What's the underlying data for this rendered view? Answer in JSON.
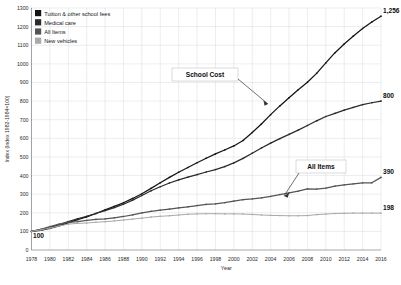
{
  "chart_data": {
    "type": "line",
    "title": "",
    "xlabel": "Year",
    "ylabel": "Index (Index 1982-1984=100)",
    "xlim": [
      1978,
      2016
    ],
    "ylim": [
      0,
      1300
    ],
    "grid": true,
    "legend_position": "top-left",
    "x": [
      1978,
      1979,
      1980,
      1981,
      1982,
      1983,
      1984,
      1985,
      1986,
      1987,
      1988,
      1989,
      1990,
      1991,
      1992,
      1993,
      1994,
      1995,
      1996,
      1997,
      1998,
      1999,
      2000,
      2001,
      2002,
      2003,
      2004,
      2005,
      2006,
      2007,
      2008,
      2009,
      2010,
      2011,
      2012,
      2013,
      2014,
      2015,
      2016
    ],
    "xticks": [
      "1978",
      "1980",
      "1982",
      "1984",
      "1986",
      "1988",
      "1990",
      "1992",
      "1994",
      "1996",
      "1998",
      "2000",
      "2002",
      "2004",
      "2006",
      "2008",
      "2010",
      "2012",
      "2014",
      "2016"
    ],
    "yticks": [
      "0",
      "100",
      "200",
      "300",
      "400",
      "500",
      "600",
      "700",
      "800",
      "900",
      "1000",
      "1100",
      "1200",
      "1300"
    ],
    "series": [
      {
        "name": "Tuition & other school fees",
        "color": "#141414",
        "end_value": 1256,
        "start_value": 100,
        "values": [
          100,
          106,
          116,
          130,
          146,
          163,
          178,
          196,
          216,
          234,
          254,
          277,
          302,
          331,
          361,
          390,
          418,
          443,
          469,
          493,
          516,
          537,
          559,
          588,
          631,
          677,
          727,
          774,
          818,
          861,
          901,
          949,
          1005,
          1060,
          1107,
          1150,
          1190,
          1225,
          1256
        ]
      },
      {
        "name": "Medical care",
        "color": "#2a2a2a",
        "end_value": 800,
        "start_value": 100,
        "values": [
          100,
          110,
          122,
          136,
          152,
          168,
          181,
          196,
          212,
          228,
          246,
          268,
          293,
          318,
          340,
          360,
          377,
          391,
          405,
          419,
          432,
          448,
          468,
          492,
          520,
          548,
          574,
          598,
          621,
          644,
          669,
          694,
          717,
          734,
          751,
          766,
          781,
          791,
          800
        ]
      },
      {
        "name": "All Items",
        "color": "#555555",
        "end_value": 390,
        "start_value": 100,
        "values": [
          100,
          111,
          126,
          139,
          148,
          152,
          159,
          164,
          167,
          173,
          180,
          189,
          199,
          208,
          214,
          220,
          226,
          232,
          239,
          245,
          248,
          254,
          263,
          270,
          274,
          280,
          288,
          298,
          307,
          316,
          328,
          327,
          332,
          343,
          350,
          355,
          361,
          361,
          390
        ]
      },
      {
        "name": "New vehicles",
        "color": "#a9a9a9",
        "end_value": 198,
        "start_value": 100,
        "values": [
          100,
          108,
          118,
          129,
          139,
          143,
          145,
          149,
          152,
          156,
          161,
          166,
          171,
          177,
          181,
          184,
          188,
          192,
          194,
          195,
          195,
          194,
          194,
          193,
          191,
          188,
          186,
          185,
          184,
          184,
          185,
          190,
          193,
          196,
          197,
          198,
          198,
          198,
          198
        ]
      }
    ],
    "annotations": [
      {
        "text": "School Cost",
        "target_series": "Tuition & other school fees"
      },
      {
        "text": "All Items",
        "target_series": "All Items"
      }
    ],
    "end_labels": [
      "1,256",
      "800",
      "390",
      "198"
    ],
    "origin_label": "100"
  },
  "legend": {
    "items": [
      {
        "label": "Tuition & other school fees",
        "color": "#141414"
      },
      {
        "label": "Medical care",
        "color": "#2a2a2a"
      },
      {
        "label": "All Items",
        "color": "#555555"
      },
      {
        "label": "New vehicles",
        "color": "#a9a9a9"
      }
    ]
  }
}
